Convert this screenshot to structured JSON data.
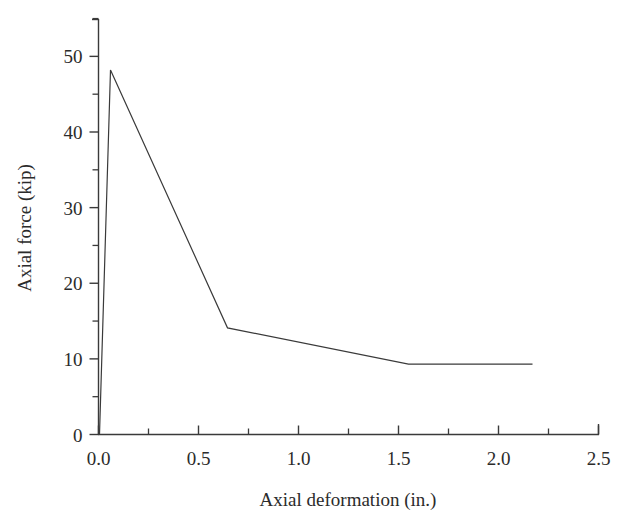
{
  "chart_data": {
    "type": "line",
    "title": "",
    "xlabel": "Axial deformation (in.)",
    "ylabel": "Axial force (kip)",
    "xlim": [
      0.0,
      2.5
    ],
    "ylim": [
      0,
      55
    ],
    "xticks": [
      0.0,
      0.5,
      1.0,
      1.5,
      2.0,
      2.5
    ],
    "xtick_labels": [
      "0.0",
      "0.5",
      "1.0",
      "1.5",
      "2.0",
      "2.5"
    ],
    "xminor_ticks": [
      0.25,
      0.75,
      1.25,
      1.75,
      2.25
    ],
    "yticks": [
      0,
      10,
      20,
      30,
      40,
      50
    ],
    "ytick_labels": [
      "0",
      "10",
      "20",
      "30",
      "40",
      "50"
    ],
    "yminor_ticks": [
      5,
      15,
      25,
      35,
      45,
      55
    ],
    "grid": false,
    "legend": null,
    "series": [
      {
        "name": "Axial force vs axial deformation",
        "color": "#3a3a3a",
        "line_width": 1.2,
        "x": [
          0.005,
          0.06,
          0.645,
          1.55,
          2.17
        ],
        "y": [
          0.0,
          48.2,
          14.1,
          9.3,
          9.3
        ]
      }
    ],
    "annotations": []
  },
  "axes": {
    "x_axis_name": "x-axis",
    "y_axis_name": "y-axis"
  }
}
